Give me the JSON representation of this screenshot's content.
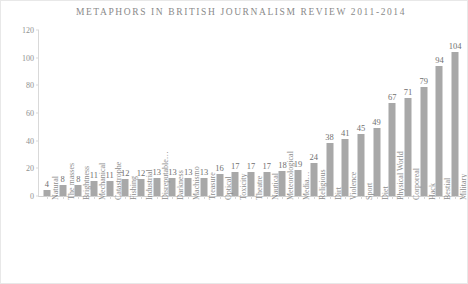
{
  "chart_data": {
    "type": "bar",
    "title": "METAPHORS IN BRITISH JOURNALISM REVIEW 2011-2014",
    "xlabel": "",
    "ylabel": "",
    "ylim": [
      0,
      120
    ],
    "yticks": [
      0,
      20,
      40,
      60,
      80,
      100,
      120
    ],
    "grid": false,
    "legend": "none",
    "bar_color": "#a8a8a8",
    "background_color": "#ffffff",
    "text_color": "#8d8d8d",
    "data_labels_shown": true,
    "categories": [
      "Natural",
      "The masses",
      "Brightness",
      "Mechanical",
      "Catastrophe",
      "Fishing",
      "Industrial",
      "Disreputable…",
      "Darkness",
      "Machismo",
      "Treasure",
      "Optical",
      "Toxicity",
      "Theatre",
      "Nautical",
      "Meteorological",
      "Media…",
      "Religious",
      "Dirt",
      "Violence",
      "Sport",
      "Diet",
      "Physical World",
      "Corporeal",
      "Hack",
      "Bestial",
      "Military"
    ],
    "values": [
      4,
      8,
      8,
      11,
      11,
      12,
      12,
      13,
      13,
      13,
      13,
      16,
      17,
      17,
      17,
      18,
      19,
      24,
      38,
      41,
      45,
      49,
      67,
      71,
      79,
      94,
      104
    ]
  }
}
